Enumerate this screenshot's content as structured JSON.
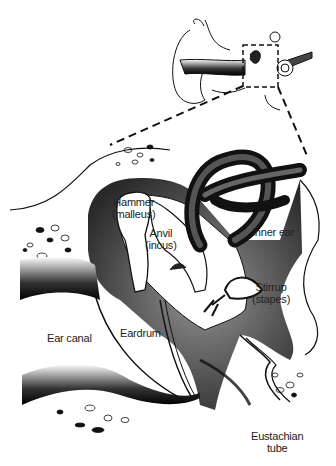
{
  "diagram": {
    "labels": {
      "hammer": "Hammer",
      "hammer_latin": "(malleus)",
      "anvil": "Anvil",
      "anvil_latin": "(incus)",
      "inner_ear": "Inner ear",
      "stirrup": "Stirrup",
      "stirrup_latin": "(stapes)",
      "ear_canal": "Ear canal",
      "eardrum": "Eardrum",
      "eustachian": "Eustachian",
      "eustachian_2": "tube"
    },
    "colors": {
      "ink": "#111111",
      "paper": "#ffffff",
      "shade": "#444444"
    }
  }
}
